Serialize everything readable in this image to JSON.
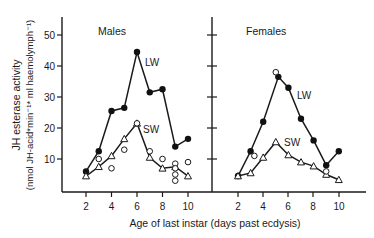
{
  "chart_data": [
    {
      "type": "line",
      "title": "Males",
      "xlabel": "Age of last instar (days past ecdysis)",
      "ylabel": "JH esterase activity",
      "ylabel_units": "(nmol JH-acid*min⁻¹* ml haemolymph⁻¹)",
      "x_ticks": [
        2,
        4,
        6,
        8,
        10
      ],
      "y_ticks": [
        10,
        20,
        30,
        40,
        50
      ],
      "ylim": [
        0,
        55
      ],
      "xlim": [
        1,
        11.5
      ],
      "grid": false,
      "series": [
        {
          "name": "LW",
          "marker": "filled-circle",
          "x": [
            2,
            3,
            4,
            5,
            6,
            7,
            8,
            9,
            10
          ],
          "values": [
            6,
            12.5,
            25.5,
            26.5,
            44.5,
            31.5,
            32.5,
            14,
            16.5
          ]
        },
        {
          "name": "SW",
          "marker": "open-triangle",
          "x": [
            2,
            3,
            4,
            5,
            6,
            7,
            8,
            9,
            10
          ],
          "values": [
            4.5,
            7.5,
            11,
            16.5,
            21.5,
            10.5,
            7,
            7.5,
            4.5
          ]
        },
        {
          "name": "individual",
          "marker": "open-circle",
          "line": false,
          "x": [
            3,
            4,
            5,
            6,
            7,
            8,
            9,
            9,
            9,
            9,
            10
          ],
          "values": [
            10,
            7,
            13,
            21.5,
            12.5,
            10,
            8.5,
            7,
            5,
            3,
            9
          ]
        }
      ],
      "annotations": [
        "LW",
        "SW"
      ]
    },
    {
      "type": "line",
      "title": "Females",
      "xlabel": "Age of last instar (days past ecdysis)",
      "x_ticks": [
        2,
        4,
        6,
        8,
        10
      ],
      "y_ticks": [
        10,
        20,
        30,
        40,
        50
      ],
      "ylim": [
        0,
        55
      ],
      "xlim": [
        1,
        11.5
      ],
      "grid": false,
      "series": [
        {
          "name": "LW",
          "marker": "filled-circle",
          "x": [
            2,
            3,
            4,
            5.2,
            6,
            7,
            8,
            9,
            10
          ],
          "values": [
            4.5,
            12.5,
            22,
            36.5,
            33,
            23,
            16,
            8,
            12.5
          ]
        },
        {
          "name": "SW",
          "marker": "open-triangle",
          "x": [
            2,
            3,
            4,
            5,
            6,
            7,
            8,
            9,
            10
          ],
          "values": [
            4.5,
            5.5,
            10.5,
            15.5,
            11.3,
            9,
            7.7,
            5,
            3.3
          ]
        },
        {
          "name": "individual",
          "marker": "open-circle",
          "line": false,
          "x": [
            3.3,
            5,
            9
          ],
          "values": [
            11,
            38,
            6
          ]
        }
      ],
      "annotations": [
        "LW",
        "SW"
      ]
    }
  ],
  "labels": {
    "males": "Males",
    "females": "Females",
    "lw": "LW",
    "sw": "SW",
    "xlabel": "Age of last instar (days past ecdysis)",
    "ylabel_line1": "JH esterase activity",
    "ylabel_line2": "(nmol JH-acid*min⁻¹* ml haemolymph⁻¹)",
    "yticks": [
      "10",
      "20",
      "30",
      "40",
      "50"
    ],
    "xticks": [
      "2",
      "4",
      "6",
      "8",
      "10"
    ]
  }
}
